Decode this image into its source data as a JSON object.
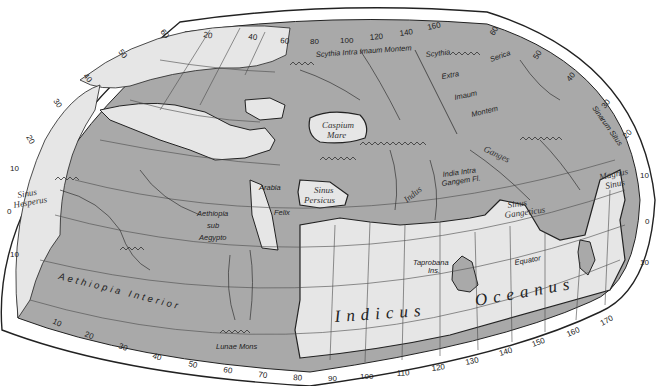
{
  "map": {
    "title": "Ptolemy's World Map",
    "colors": {
      "land": "#a9a9a9",
      "sea": "#e6e6e6",
      "border": "#ffffff",
      "outline": "#222222",
      "grid": "#4a4a4a"
    },
    "top_longitude_ticks": [
      "20",
      "40",
      "60",
      "80",
      "100",
      "120",
      "140",
      "160"
    ],
    "bottom_longitude_ticks": [
      "10",
      "20",
      "30",
      "40",
      "50",
      "60",
      "70",
      "80",
      "90",
      "100",
      "110",
      "120",
      "130",
      "140",
      "150",
      "160",
      "170"
    ],
    "left_latitude_ticks": [
      "60",
      "50",
      "40",
      "30",
      "20",
      "10",
      "0",
      "10"
    ],
    "right_latitude_ticks": [
      "60",
      "50",
      "40",
      "30",
      "20",
      "10",
      "0",
      "10"
    ],
    "labels": {
      "scythia_intra": "Scythia Intra Imaum Montem",
      "scythia": "Scythia",
      "extra": "Extra",
      "imaum": "Imaum",
      "montem": "Montem",
      "serica": "Serica",
      "sinarum_situs": "Sinarum Situs",
      "caspium": "Caspium",
      "mare": "Mare",
      "sinus_persicus_1": "Sinus",
      "sinus_persicus_2": "Persicus",
      "arabia": "Arabia",
      "felix": "Felix",
      "aethiopia_sub_1": "Aethiopia",
      "aethiopia_sub_2": "sub",
      "aethiopia_sub_3": "Aegypto",
      "sinus_hesperus_1": "Sinus",
      "sinus_hesperus_2": "Hesperus",
      "aethiopia_interior": "Aethiopia  Interior",
      "lunae_mons": "Lunae Mons",
      "indus": "Indus",
      "india_intra_1": "India Intra",
      "india_intra_2": "Gangem Fl.",
      "ganges": "Ganges",
      "sinus_gangeticus_1": "Sinus",
      "sinus_gangeticus_2": "Gangeticus",
      "magnus_sinus_1": "Magnus",
      "magnus_sinus_2": "Sinus",
      "taprobana_1": "Taprobana",
      "taprobana_2": "Ins.",
      "equator": "Equator",
      "indicus": "Indicus",
      "oceanus": "Oceanus"
    }
  }
}
